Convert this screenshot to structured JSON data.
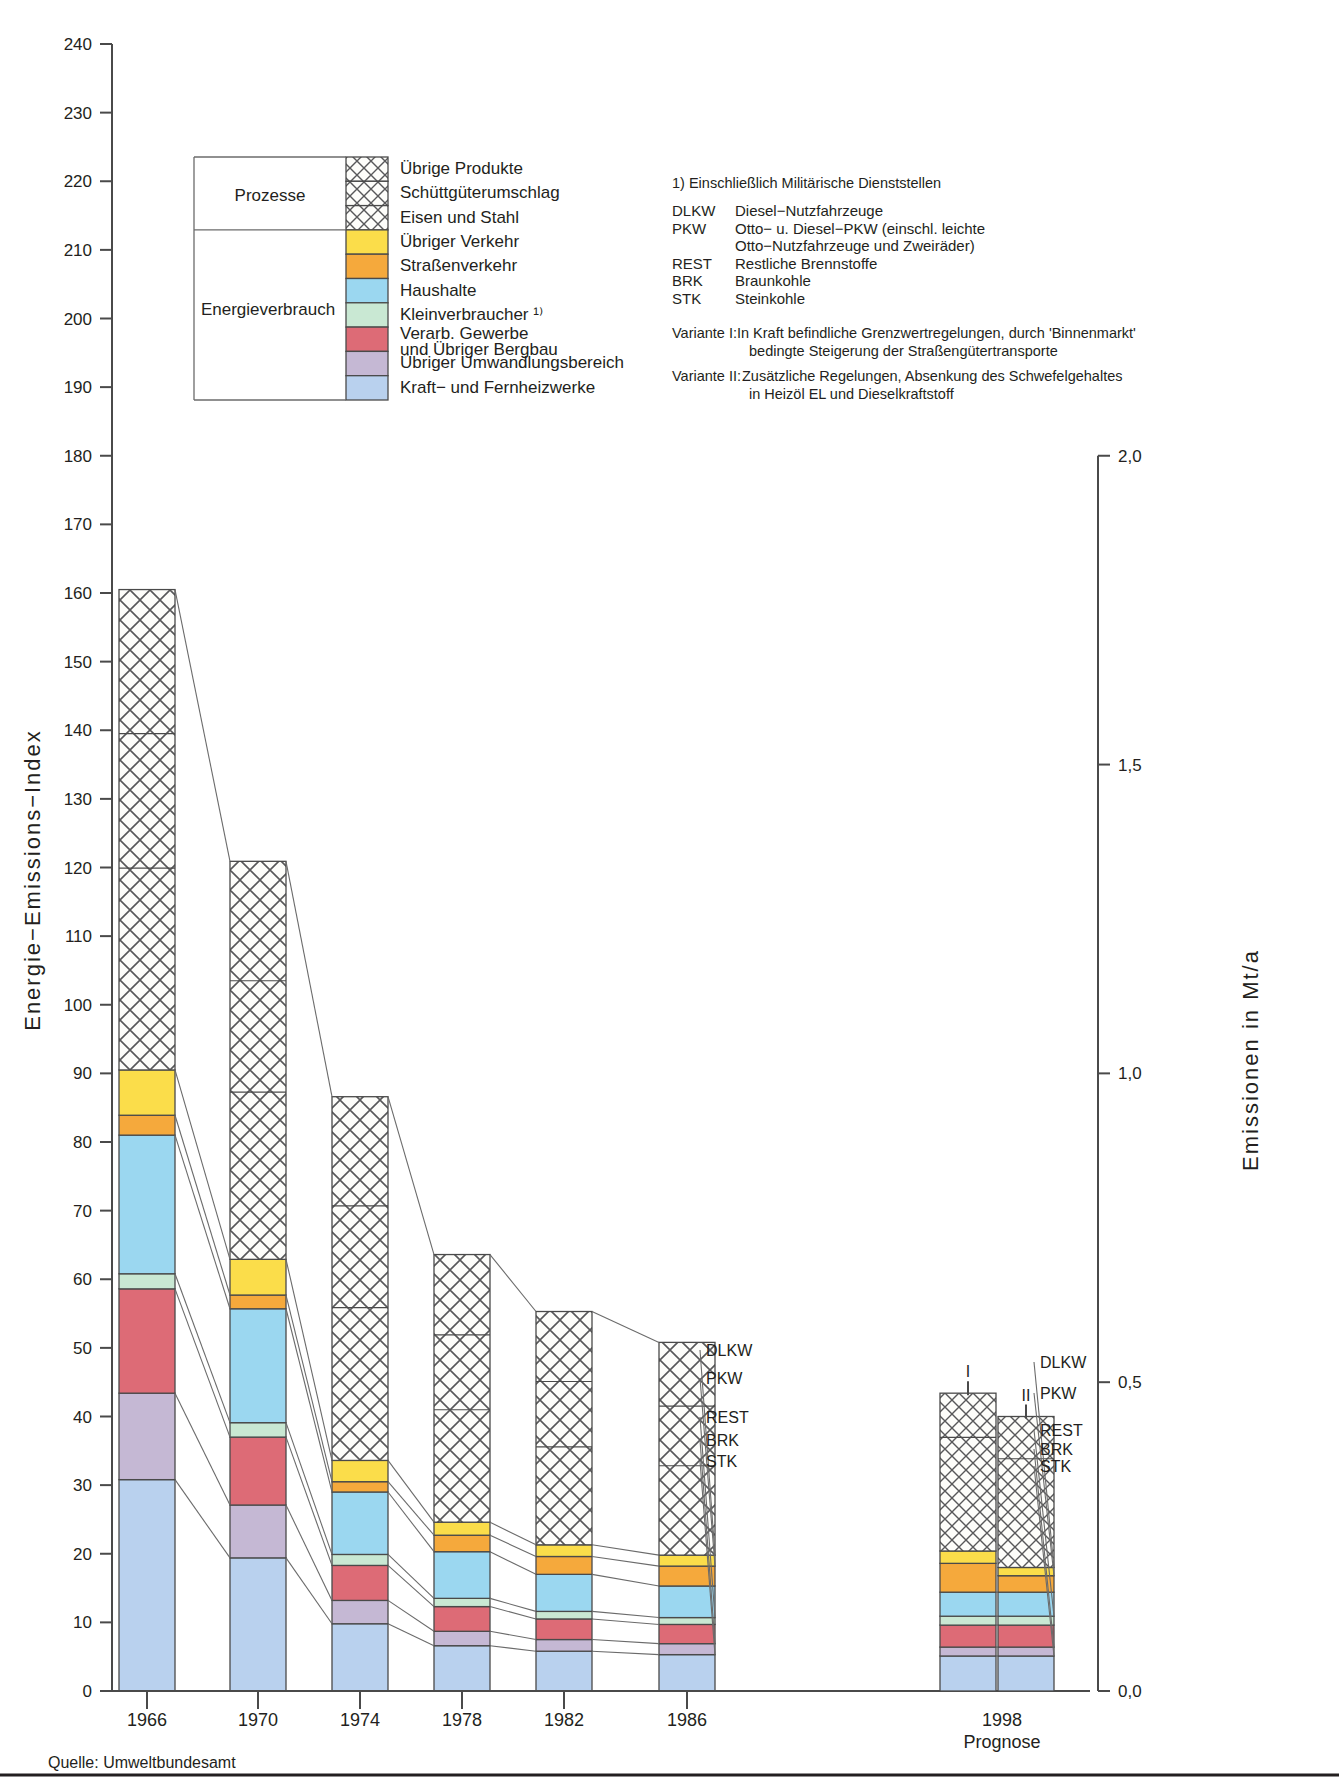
{
  "axes": {
    "left_title": "Energie−Emissions−Index",
    "right_title": "Emissionen in Mt/a",
    "left_ticks": [
      0,
      10,
      20,
      30,
      40,
      50,
      60,
      70,
      80,
      90,
      100,
      110,
      120,
      130,
      140,
      150,
      160,
      170,
      180,
      190,
      200,
      210,
      220,
      230,
      240
    ],
    "right_ticks": [
      "0,0",
      "0,5",
      "1,0",
      "1,5",
      "2,0"
    ],
    "right_tick_values": [
      0,
      0.5,
      1.0,
      1.5,
      2.0
    ]
  },
  "legend": {
    "group_upper": "Prozesse",
    "group_lower": "Energieverbrauch",
    "items": [
      {
        "label": "Übrige Produkte",
        "pattern": "hatch",
        "color": "#ffffff"
      },
      {
        "label": "Schüttgüterumschlag",
        "pattern": "hatch",
        "color": "#ffffff"
      },
      {
        "label": "Eisen und Stahl",
        "pattern": "hatch",
        "color": "#ffffff"
      },
      {
        "label": "Übriger Verkehr",
        "pattern": "solid",
        "color": "#fbdd4a"
      },
      {
        "label": "Straßenverkehr",
        "pattern": "solid",
        "color": "#f5a93c"
      },
      {
        "label": "Haushalte",
        "pattern": "solid",
        "color": "#9bd7f0"
      },
      {
        "label": "Kleinverbraucher ¹⁾",
        "pattern": "solid",
        "color": "#c9e8d3"
      },
      {
        "label": "Verarb. Gewerbe",
        "label2": "und Übriger Bergbau",
        "pattern": "solid",
        "color": "#dd6b76"
      },
      {
        "label": "Übriger Umwandlungsbereich",
        "pattern": "solid",
        "color": "#c5b8d4"
      },
      {
        "label": "Kraft− und Fernheizwerke",
        "pattern": "solid",
        "color": "#b9d1ee"
      }
    ]
  },
  "notes": {
    "footnote": "1) Einschließlich Militärische Dienststellen",
    "abbreviations": [
      {
        "key": "DLKW",
        "text": "Diesel−Nutzfahrzeuge"
      },
      {
        "key": "PKW",
        "text": "Otto− u. Diesel−PKW (einschl. leichte"
      },
      {
        "key": "",
        "text": "Otto−Nutzfahrzeuge und Zweiräder)"
      },
      {
        "key": "REST",
        "text": "Restliche Brennstoffe"
      },
      {
        "key": "BRK",
        "text": "Braunkohle"
      },
      {
        "key": "STK",
        "text": "Steinkohle"
      }
    ],
    "variante1_key": "Variante I:",
    "variante1_l1": "In Kraft befindliche Grenzwertregelungen, durch 'Binnenmarkt'",
    "variante1_l2": "bedingte Steigerung der Straßengütertransporte",
    "variante2_key": "Variante II:",
    "variante2_l1": "Zusätzliche Regelungen, Absenkung des Schwefelgehaltes",
    "variante2_l2": "in Heizöl EL und Dieselkraftstoff"
  },
  "source": "Quelle: Umweltbundesamt",
  "end_labels": [
    "DLKW",
    "PKW",
    "REST",
    "BRK",
    "STK"
  ],
  "prognose": {
    "year": "1998",
    "caption": "Prognose",
    "variant_labels": [
      "I",
      "II"
    ]
  },
  "chart_data": {
    "type": "bar",
    "title": "",
    "xlabel": "",
    "ylabel": "Energie−Emissions−Index",
    "ylim": [
      0,
      240
    ],
    "categories": [
      "1966",
      "1970",
      "1974",
      "1978",
      "1982",
      "1986",
      "1998 I",
      "1998 II"
    ],
    "stack_order": [
      "Kraft− und Fernheizwerke",
      "Übriger Umwandlungsbereich",
      "Verarb. Gewerbe und Übriger Bergbau",
      "Kleinverbraucher",
      "Haushalte",
      "Straßenverkehr",
      "Übriger Verkehr",
      "Eisen und Stahl",
      "Schüttgüterumschlag",
      "Übrige Produkte"
    ],
    "series": [
      {
        "name": "Kraft− und Fernheizwerke",
        "color": "#b9d1ee",
        "pattern": "solid",
        "values": [
          30.8,
          19.4,
          9.8,
          6.6,
          5.8,
          5.3,
          5.1,
          5.1
        ]
      },
      {
        "name": "Übriger Umwandlungsbereich",
        "color": "#c5b8d4",
        "pattern": "solid",
        "values": [
          12.6,
          7.7,
          3.4,
          2.1,
          1.7,
          1.6,
          1.3,
          1.3
        ]
      },
      {
        "name": "Verarb. Gewerbe und Übriger Bergbau",
        "color": "#dd6b76",
        "pattern": "solid",
        "values": [
          15.2,
          9.9,
          5.1,
          3.6,
          3.0,
          2.8,
          3.2,
          3.2
        ]
      },
      {
        "name": "Kleinverbraucher",
        "color": "#c9e8d3",
        "pattern": "solid",
        "values": [
          2.2,
          2.1,
          1.6,
          1.2,
          1.1,
          1.0,
          1.3,
          1.3
        ]
      },
      {
        "name": "Haushalte",
        "color": "#9bd7f0",
        "pattern": "solid",
        "values": [
          20.2,
          16.6,
          9.1,
          6.8,
          5.4,
          4.6,
          3.5,
          3.5
        ]
      },
      {
        "name": "Straßenverkehr",
        "color": "#f5a93c",
        "pattern": "solid",
        "values": [
          2.9,
          2.0,
          1.5,
          2.4,
          2.6,
          2.9,
          4.2,
          2.4
        ]
      },
      {
        "name": "Übriger Verkehr",
        "color": "#fbdd4a",
        "pattern": "solid",
        "values": [
          6.6,
          5.2,
          3.1,
          1.9,
          1.7,
          1.6,
          1.8,
          1.2
        ]
      },
      {
        "name": "Prozesse (Eisen und Stahl / Schüttgüterumschlag / Übrige Produkte)",
        "color": "#ffffff",
        "pattern": "hatch",
        "values": [
          70.0,
          58.0,
          53.0,
          39.0,
          34.0,
          31.0,
          23.0,
          22.0
        ]
      }
    ],
    "totals": [
      160.5,
      120.9,
      86.6,
      63.6,
      55.3,
      50.8,
      43.4,
      40.0
    ],
    "right_axis": {
      "label": "Emissionen in Mt/a",
      "ticks": [
        "0,0",
        "0,5",
        "1,0",
        "1,5",
        "2,0"
      ],
      "values": [
        0,
        0.5,
        1.0,
        1.5,
        2.0
      ]
    },
    "grid": false,
    "legend_position": "top-left"
  }
}
